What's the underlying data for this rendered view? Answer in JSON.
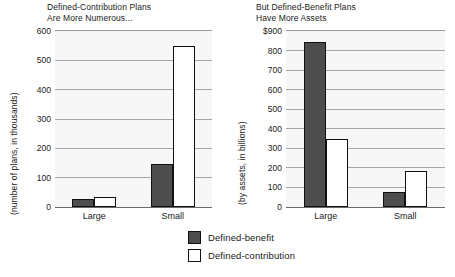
{
  "chart_data": [
    {
      "type": "bar",
      "id": "plans-count",
      "title": "Defined-Contribution Plans\nAre More Numerous...",
      "xlabel": "",
      "ylabel": "(number of plans, in thousands)",
      "categories": [
        "Large",
        "Small"
      ],
      "yticks": [
        "0",
        "100",
        "200",
        "300",
        "400",
        "500",
        "600"
      ],
      "ylim": [
        0,
        600
      ],
      "grid": true,
      "legend_position": "bottom-center",
      "series": [
        {
          "name": "Defined-benefit",
          "color": "#4d4d4d",
          "values": [
            27,
            145
          ]
        },
        {
          "name": "Defined-contribution",
          "color": "#ffffff",
          "values": [
            33,
            550
          ]
        }
      ]
    },
    {
      "type": "bar",
      "id": "plans-assets",
      "title": "But Defined-Benefit Plans\nHave More Assets",
      "xlabel": "",
      "ylabel": "(by assets, in billions)",
      "categories": [
        "Large",
        "Small"
      ],
      "yticks": [
        "0",
        "100",
        "200",
        "300",
        "400",
        "500",
        "600",
        "700",
        "800",
        "$900"
      ],
      "ylim": [
        0,
        900
      ],
      "grid": true,
      "legend_position": "bottom-center",
      "series": [
        {
          "name": "Defined-benefit",
          "color": "#4d4d4d",
          "values": [
            845,
            78
          ]
        },
        {
          "name": "Defined-contribution",
          "color": "#ffffff",
          "values": [
            348,
            182
          ]
        }
      ]
    }
  ],
  "legend": {
    "items": [
      {
        "label": "Defined-benefit",
        "color": "#4d4d4d"
      },
      {
        "label": "Defined-contribution",
        "color": "#ffffff"
      }
    ]
  }
}
